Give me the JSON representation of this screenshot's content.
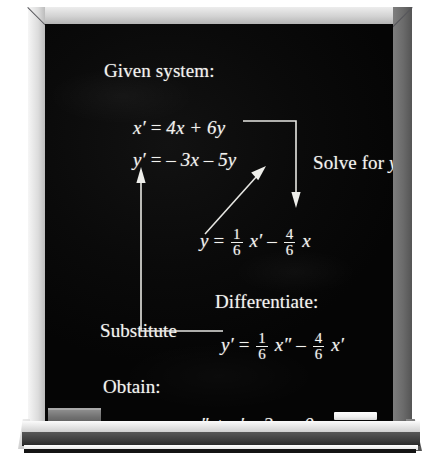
{
  "scene": {
    "kind": "chalkboard-illustration",
    "background_color": "#ffffff",
    "board_color": "#080808",
    "chalk_color": "#f3f3ef",
    "frame_light_color": "#e4e4e4",
    "frame_dark_color": "#5c5c5c"
  },
  "board": {
    "labels": {
      "given_system": "Given system:",
      "solve_for": "Solve for",
      "solve_for_var": "y",
      "differentiate": "Differentiate:",
      "substitute": "Substitute",
      "obtain": "Obtain:"
    },
    "equations": {
      "sys1": {
        "lhs": "x′",
        "eq": "=",
        "rhs": "4x + 6y"
      },
      "sys2": {
        "lhs": "y′",
        "eq": "=",
        "rhs": "– 3x – 5y"
      },
      "solved": {
        "lhs": "y",
        "eq": "=",
        "f1_num": "1",
        "f1_den": "6",
        "t1": "x′",
        "op": "–",
        "f2_num": "4",
        "f2_den": "6",
        "t2": "x"
      },
      "differentiated": {
        "lhs": "y′",
        "eq": "=",
        "f1_num": "1",
        "f1_den": "6",
        "t1": "x″",
        "op": "–",
        "f2_num": "4",
        "f2_den": "6",
        "t2": "x′"
      },
      "result": "x″ + x′ – 2x = 0"
    },
    "arrows": [
      {
        "name": "solve-for-y-arrow",
        "from": "x′ = 4x + 6y",
        "to": "y = 1/6 x′ – 4/6 x",
        "label": "Solve for y",
        "style": "elbow-right-down"
      },
      {
        "name": "differentiate-arrow",
        "from": "y = 1/6 x′ – 4/6 x",
        "to": "y′ = – 3x – 5y",
        "label": "Differentiate:",
        "style": "diagonal-up-right"
      },
      {
        "name": "substitute-arrow",
        "from": "y′ = 1/6 x″ – 4/6 x′",
        "to": "x′ = 4x + 6y",
        "label": "Substitute",
        "style": "elbow-left-up"
      }
    ],
    "tray_items": [
      {
        "name": "eraser",
        "color": "#6f6f6f"
      },
      {
        "name": "chalk-stick",
        "color": "#ffffff"
      }
    ]
  }
}
